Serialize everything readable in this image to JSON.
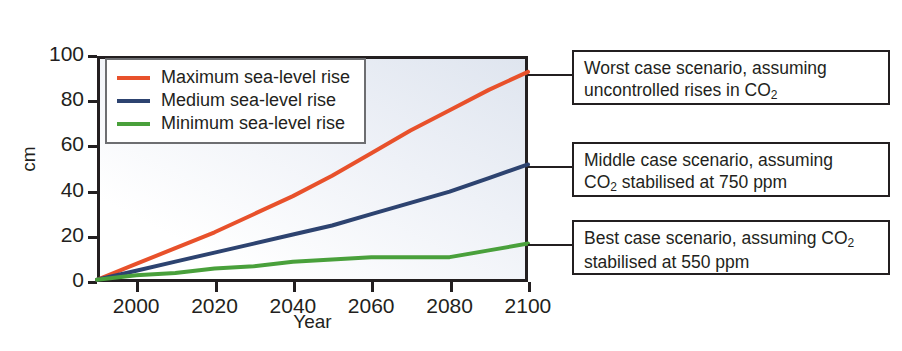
{
  "chart_data": {
    "type": "line",
    "title": "",
    "xlabel": "Year",
    "ylabel": "cm",
    "xlim": [
      1990,
      2100
    ],
    "ylim": [
      0,
      100
    ],
    "xticks": [
      "2000",
      "2020",
      "2040",
      "2060",
      "2080",
      "2100"
    ],
    "xtick_values": [
      2000,
      2020,
      2040,
      2060,
      2080,
      2100
    ],
    "yticks": [
      "0",
      "20",
      "40",
      "60",
      "80",
      "100"
    ],
    "ytick_values": [
      0,
      20,
      40,
      60,
      80,
      100
    ],
    "grid": false,
    "legend_position": "top-left",
    "x": [
      1990,
      2000,
      2010,
      2020,
      2030,
      2040,
      2050,
      2060,
      2070,
      2080,
      2090,
      2100
    ],
    "series": [
      {
        "name": "Maximum sea-level rise",
        "color": "#e8512b",
        "values": [
          1,
          8,
          15,
          22,
          30,
          38,
          47,
          57,
          67,
          76,
          85,
          93
        ]
      },
      {
        "name": "Medium sea-level rise",
        "color": "#2d4370",
        "values": [
          1,
          5,
          9,
          13,
          17,
          21,
          25,
          30,
          35,
          40,
          46,
          52
        ]
      },
      {
        "name": "Minimum sea-level rise",
        "color": "#49a03b",
        "values": [
          1,
          3,
          4,
          6,
          7,
          9,
          10,
          11,
          11,
          11,
          14,
          17
        ]
      }
    ]
  },
  "axes": {
    "y_label": "cm",
    "x_label": "Year"
  },
  "legend": {
    "items": [
      {
        "label": "Maximum sea-level rise",
        "color": "#e8512b"
      },
      {
        "label": "Medium sea-level rise",
        "color": "#2d4370"
      },
      {
        "label": "Minimum sea-level rise",
        "color": "#49a03b"
      }
    ]
  },
  "annotations": [
    {
      "name": "worst-case",
      "line1": "Worst case scenario, assuming",
      "line2_pre": "uncontrolled rises in CO",
      "line2_sub": "2",
      "line2_post": ""
    },
    {
      "name": "middle-case",
      "line1": "Middle case scenario, assuming",
      "line2_pre": "CO",
      "line2_sub": "2",
      "line2_post": " stabilised at 750 ppm"
    },
    {
      "name": "best-case",
      "line1_pre": "Best case scenario, assuming CO",
      "line1_sub": "2",
      "line2": "stabilised at 550 ppm"
    }
  ],
  "colors": {
    "maximum": "#e8512b",
    "medium": "#2d4370",
    "minimum": "#49a03b",
    "axis": "#231f20",
    "plot_bg_top": "#dfe5ef",
    "plot_bg_bottom": "#ffffff"
  }
}
